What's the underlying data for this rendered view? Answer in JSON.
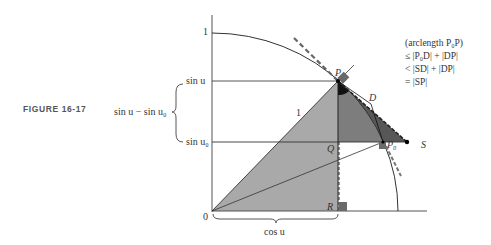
{
  "caption": "FIGURE 16-17",
  "axis_labels": {
    "y_one": "1",
    "origin": "0",
    "sin_u": "sin u",
    "sin_u0": "sin u₀",
    "brace_label": "sin u − sin u₀",
    "cos_u": "cos u",
    "radius_label": "1"
  },
  "points": {
    "P": "P",
    "P0": "P₀",
    "D": "D",
    "S": "S",
    "Q": "Q",
    "R": "R"
  },
  "inequality": {
    "line1": "(arclength P₀P)",
    "line2": "≤ |P₀D| + |DP|",
    "line3": "< |SD| + |DP|",
    "line4": "= |SP|"
  },
  "colors": {
    "light_fill": "#a9a9a9",
    "mid_fill": "#7d7d7d",
    "dark_fill": "#3a3a3a",
    "line": "#333333",
    "marker": "#6a6a6a"
  }
}
